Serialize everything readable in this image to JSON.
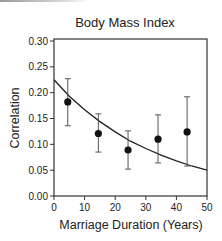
{
  "chart_data": {
    "type": "scatter",
    "title": "Body Mass Index",
    "xlabel": "Marriage Duration (Years)",
    "ylabel": "Correlation",
    "xlim": [
      0,
      50
    ],
    "ylim": [
      0.0,
      0.3
    ],
    "xticks": [
      0,
      10,
      20,
      30,
      40,
      50
    ],
    "xtick_labels": [
      "0",
      "10",
      "20",
      "30",
      "40",
      "50"
    ],
    "yticks": [
      0.0,
      0.05,
      0.1,
      0.15,
      0.2,
      0.25,
      0.3
    ],
    "ytick_labels": [
      "0.00",
      "0.05",
      "0.10",
      "0.15",
      "0.20",
      "0.25",
      "0.30"
    ],
    "grid": false,
    "legend": null,
    "series": [
      {
        "name": "Observed correlation",
        "kind": "points_with_error_bars",
        "x": [
          4.5,
          14.5,
          24.2,
          34.0,
          43.5
        ],
        "y": [
          0.182,
          0.121,
          0.089,
          0.11,
          0.124
        ],
        "err_low": [
          0.136,
          0.085,
          0.052,
          0.064,
          0.058
        ],
        "err_high": [
          0.227,
          0.159,
          0.126,
          0.157,
          0.192
        ]
      },
      {
        "name": "Fitted decay curve",
        "kind": "line",
        "x": [
          0,
          5,
          10,
          15,
          20,
          25,
          30,
          35,
          40,
          45,
          50
        ],
        "y": [
          0.225,
          0.193,
          0.167,
          0.144,
          0.124,
          0.106,
          0.092,
          0.079,
          0.068,
          0.058,
          0.05
        ]
      }
    ]
  },
  "colors": {
    "ink": "#222222",
    "axis": "#333333",
    "errorbar": "#555555",
    "background": "#ffffff"
  }
}
